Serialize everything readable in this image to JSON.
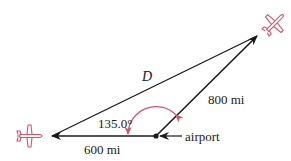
{
  "diagram": {
    "labels": {
      "distance_unknown": "D",
      "leg_two": "800 mi",
      "angle": "135.0°",
      "airport": "airport",
      "leg_one": "600 mi"
    },
    "colors": {
      "lines": "#1a1a1a",
      "accent": "#d0566a"
    }
  }
}
